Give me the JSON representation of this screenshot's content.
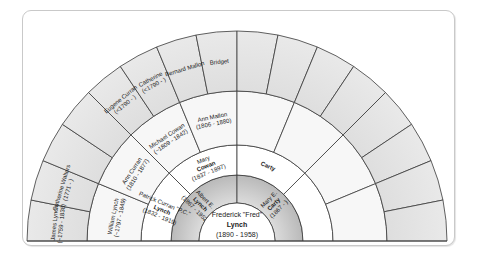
{
  "chart_title": "Fan chart",
  "colors": {
    "line": "#3a3a3a",
    "white_cell": "#ffffff",
    "light_cell": "#f4f4f4",
    "gray_cell_dark": "#bdbdbd",
    "gray_cell_light": "#e6e6e6",
    "text": "#1a1a1a"
  },
  "geometry": {
    "cx": 237,
    "cy": 241,
    "radii": [
      38,
      66,
      96,
      150,
      210
    ]
  },
  "root": {
    "name_line1": "Frederick \"Fred\"",
    "name_line2": "Lynch",
    "dates": "(1890 - 1958)"
  },
  "generations": [
    {
      "gen": 1,
      "shade": "gray",
      "people": [
        {
          "lines": [
            "Albert E.",
            "Lynch",
            "(1867 - 1952)"
          ],
          "bold": [
            1
          ]
        },
        {
          "lines": [
            "Mary E.",
            "Carty",
            "(1867 - )"
          ],
          "bold": [
            1
          ]
        }
      ]
    },
    {
      "gen": 2,
      "shade": "white",
      "people": [
        {
          "lines": [
            "Patrick Curran \"P.C.\"",
            "Lynch",
            "(1832 - 1919)"
          ],
          "bold": [
            1
          ]
        },
        {
          "lines": [
            "Mary",
            "Cowan",
            "(1837 - 1897)"
          ],
          "bold": [
            1
          ]
        },
        {
          "lines": [
            "Carty"
          ],
          "bold": [
            0
          ]
        },
        {
          "lines": []
        }
      ]
    },
    {
      "gen": 3,
      "shade": "light",
      "people": [
        {
          "lines": [
            "William Lynch",
            "(~1797 - 1849)"
          ]
        },
        {
          "lines": [
            "Ann Curran",
            "(1810 - 1877)"
          ]
        },
        {
          "lines": [
            "Michael Cowan",
            "(~1809 - 1842)"
          ]
        },
        {
          "lines": [
            "Ann Mallon",
            "(1806 - 1880)"
          ]
        },
        {
          "lines": []
        },
        {
          "lines": []
        },
        {
          "lines": []
        },
        {
          "lines": []
        }
      ]
    },
    {
      "gen": 4,
      "shade": "gray",
      "people": [
        {
          "lines": [
            "James Lynch",
            "(~1759 - 1838)"
          ]
        },
        {
          "lines": [
            "Catherine Walters",
            "(1771 - )"
          ]
        },
        {
          "lines": []
        },
        {
          "lines": []
        },
        {
          "lines": [
            "Eugene Curran",
            "(<1790 - )"
          ]
        },
        {
          "lines": [
            "Catherine",
            "(<1790 - )"
          ]
        },
        {
          "lines": [
            "Bernard Mallon"
          ]
        },
        {
          "lines": [
            "Bridget"
          ]
        },
        {
          "lines": []
        },
        {
          "lines": []
        },
        {
          "lines": []
        },
        {
          "lines": []
        },
        {
          "lines": []
        },
        {
          "lines": []
        },
        {
          "lines": []
        },
        {
          "lines": []
        }
      ]
    }
  ]
}
